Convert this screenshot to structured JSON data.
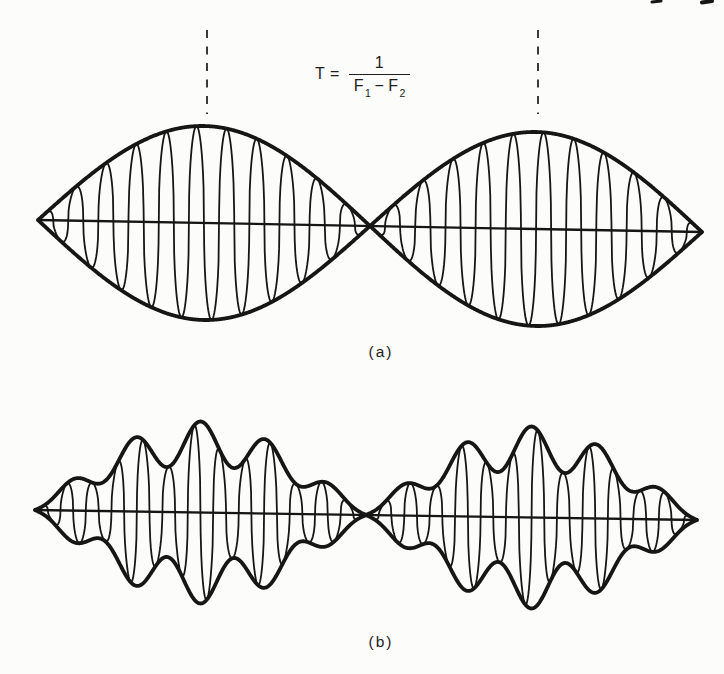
{
  "page": {
    "background": "#fcfcfa",
    "ink": "#161616",
    "marker_color": "#3a3a3a"
  },
  "labels": {
    "a": "(a)",
    "b": "(b)"
  },
  "formula": {
    "lhs": "T =",
    "numerator": "1",
    "den_f": "F",
    "den_sub1": "1",
    "den_minus": "−",
    "den_sub2": "2"
  },
  "page_edge_marks": [
    {
      "x1": 652,
      "y1": 2,
      "x2": 661,
      "y2": 1,
      "w": 3
    },
    {
      "x1": 702,
      "y1": 2.5,
      "x2": 712,
      "y2": 1,
      "w": 4
    }
  ],
  "chart_data": [
    {
      "id": "a",
      "type": "line",
      "label": "(a)",
      "description": "Beat waveform of two tones F1 and F2: high-frequency carrier inside a smooth half-sine beat envelope; two lens-shaped lobes meeting at a zero-amplitude node; beat period T marked by dashed lines at the envelope maxima",
      "annotation": "T = 1 / (F1 - F2)",
      "x_start": 38,
      "x_end": 702,
      "axis_y_left": 220,
      "axis_y_right": 232,
      "amplitude_px": 97,
      "lobes": 2,
      "carrier_cycles_per_lobe": 11,
      "envelope_ripples_per_lobe": 0,
      "envelope_ripple_depth": 0,
      "carrier_shape_exponent": 0.42,
      "period_markers": {
        "x_left": 207,
        "x_right": 538,
        "y_top": 30,
        "y_bottom": 114,
        "dash": "8 8.5"
      }
    },
    {
      "id": "b",
      "type": "line",
      "label": "(b)",
      "description": "Beat waveform with a rippled (scalloped) envelope: carrier inside a half-sine envelope modulated by about five ripple bumps per lobe, small bumps near the nodes and a broad dome at each lobe centre",
      "x_start": 35,
      "x_end": 697,
      "axis_y_left": 510,
      "axis_y_right": 520,
      "amplitude_px": 91,
      "lobes": 2,
      "carrier_cycles_per_lobe": 13,
      "envelope_ripples_per_lobe": 5,
      "envelope_ripple_depth": 0.24,
      "carrier_shape_exponent": 0.45
    }
  ]
}
